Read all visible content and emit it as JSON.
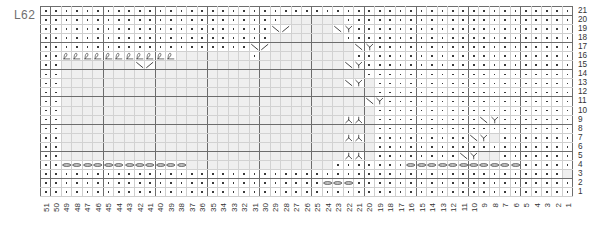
{
  "chart": {
    "label": "L62",
    "type": "knitting-stitch-chart",
    "columns": 51,
    "rows": 21,
    "row_numbers": [
      21,
      20,
      19,
      18,
      17,
      16,
      15,
      14,
      13,
      12,
      11,
      10,
      9,
      8,
      7,
      6,
      5,
      4,
      3,
      2,
      1
    ],
    "column_numbers": [
      51,
      50,
      49,
      48,
      47,
      46,
      45,
      44,
      43,
      42,
      41,
      40,
      39,
      38,
      37,
      36,
      35,
      34,
      33,
      32,
      31,
      30,
      29,
      28,
      27,
      26,
      25,
      24,
      23,
      22,
      21,
      20,
      19,
      18,
      17,
      16,
      15,
      14,
      13,
      12,
      11,
      10,
      9,
      8,
      7,
      6,
      5,
      4,
      3,
      2,
      1
    ],
    "legend_symbols": {
      "knit": "dot",
      "no_stitch": "blank-shaded",
      "loop_cast_on": "loop-scallop",
      "bind_off": "chain-oval",
      "ssk_left": "diagonal-left",
      "k2tog_right": "diagonal-right",
      "double_decrease": "y-shape"
    },
    "colors": {
      "grid_line": "#b9b9b9",
      "heavy_line": "#6d6d6d",
      "cell_bg": "#ffffff",
      "shaded_bg": "#ececec",
      "symbol": "#3a3a3a",
      "label_text": "#6f6f6f"
    },
    "grid": [
      {
        "row": 21,
        "cells": "DDDDDDDDDDDDDDDDDDDDDDDDDDDDDDDDDDDDDDDDDDDDDDDDDDD"
      },
      {
        "row": 20,
        "cells": "DDDDDDDDDDDDDDDDDDDDDDD......DDDDDDDDDDDDDDDDDDDDDD"
      },
      {
        "row": 19,
        "cells": "DDDDDDDDDDDDDDDDDDDDDDSR....LYDDDDDDDDDDDDDDDDDDDDD"
      },
      {
        "row": 18,
        "cells": "DDDDDDDDDDDDDDDDDDDDDD.......DDDDDDDDDDDDDDDDDDDDDD"
      },
      {
        "row": 17,
        "cells": "DDDDDDDDDDDDDDDDDDDDSR........LYDDDDDDDDDDDDDDDDDDD"
      },
      {
        "row": 16,
        "cells": "DDOOOOOOOOOOO.......D.........DDDDDDDDDDDDDDDDDDDDD"
      },
      {
        "row": 15,
        "cells": "DD.......SR..................LYDDDDDDDDDDDDDDDDDDDD"
      },
      {
        "row": 14,
        "cells": "DD.............................DDDDDDDDDDDDDDDDDDDD"
      },
      {
        "row": 13,
        "cells": "DD...........................LY.DDDDDDDDDDDDDDDDDDD"
      },
      {
        "row": 12,
        "cells": "DD..............................DDDDDDDDDDDDDDDDDDD"
      },
      {
        "row": 11,
        "cells": "DD.............................LYDDDDDDDDDDDDDDDDDD"
      },
      {
        "row": 10,
        "cells": "DD..............................DDDDDDDDDDDDDDDDDDD"
      },
      {
        "row": 9,
        "cells": "DD...........................AA.DDDDDDDDDDLYDDDDDDD"
      },
      {
        "row": 8,
        "cells": "DD..............................DDDDDDDDDDDDDDDDDDD"
      },
      {
        "row": 7,
        "cells": "DD...........................AA.DDDDDDDDDLY.DDDDDDD"
      },
      {
        "row": 6,
        "cells": "DD..............................DDDDDDDDDDDDDDDDDDD"
      },
      {
        "row": 5,
        "cells": "DD...........................AA.DDDDDDDDLY..DDDDDDD"
      },
      {
        "row": 4,
        "cells": "DDCCCCCCCCCCCC..............DDDDDDDCCCCCCCCCCCDDDDD"
      },
      {
        "row": 3,
        "cells": "DDDDDDDDDDDDDDDDDDDDDDDDDDDDDDDDDDDDDDDDDDDDDDDDDD"
      },
      {
        "row": 2,
        "cells": "DDDDDDDDDDDDDDDDDDDDDDDDDDDCCCDDDDDDDDDDDDDDDDDDDDD"
      },
      {
        "row": 1,
        "cells": "DDDDDDDDDDDDDDDDDDDDDDDDDDDDDDDDDDDDDDDDDDDDDDDDDDD"
      }
    ]
  }
}
